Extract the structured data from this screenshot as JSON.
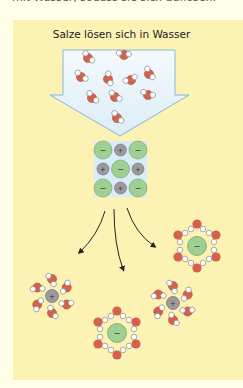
{
  "header": {
    "cut_text": "mit Wasser, sodass sie sich auflösen."
  },
  "diagram": {
    "title": "Salze lösen sich in Wasser",
    "colors": {
      "panel": "#fcf2b3",
      "page": "#fefee9",
      "oxygen": "#d5604b",
      "hydrogen": "#ffffff",
      "anion": "#9fd093",
      "cation": "#9c9a9c",
      "arrow_fill": "#eaf5fb",
      "arrow_stroke": "#86b8d8"
    },
    "crystal": {
      "grid": [
        [
          "-",
          "+",
          "-"
        ],
        [
          "+",
          "-",
          "+"
        ],
        [
          "-",
          "+",
          "-"
        ]
      ],
      "anion_symbol": "−",
      "cation_symbol": "+"
    },
    "hydrated_ions": [
      {
        "type": "cation",
        "symbol": "+",
        "label": "hydrated cation left"
      },
      {
        "type": "anion",
        "symbol": "−",
        "label": "hydrated anion bottom"
      },
      {
        "type": "anion",
        "symbol": "−",
        "label": "hydrated anion right"
      },
      {
        "type": "cation",
        "symbol": "+",
        "label": "hydrated cation right"
      }
    ]
  }
}
